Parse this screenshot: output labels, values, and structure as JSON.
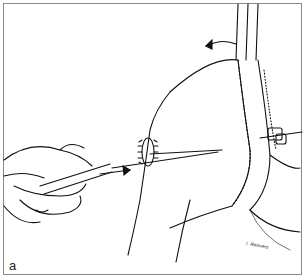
{
  "figure": {
    "panel_label": "a",
    "signature": "I. Reimers"
  }
}
